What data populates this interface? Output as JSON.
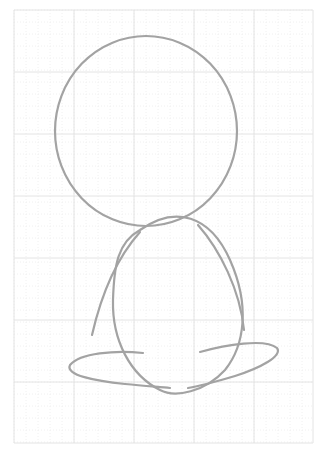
{
  "canvas": {
    "width": 323,
    "height": 457,
    "background": "#ffffff"
  },
  "grid": {
    "x0": 14,
    "y0": 10,
    "x1": 313,
    "y1": 443,
    "major_x": [
      14,
      74,
      134,
      194,
      254,
      313
    ],
    "major_y": [
      10,
      72,
      134,
      196,
      258,
      320,
      382,
      443
    ],
    "minor_step": 12,
    "major_color": "#e4e4e4",
    "minor_color": "#f0f0f0"
  },
  "sketch": {
    "stroke_color": "#a3a3a3",
    "stroke_width": 2.2,
    "shapes": [
      {
        "name": "head-circle",
        "type": "ellipse",
        "cx": 146,
        "cy": 131,
        "rx": 91,
        "ry": 95
      },
      {
        "name": "body-oval",
        "d": "M 140 230 C 175 205, 210 215, 230 260 C 250 305, 245 345, 225 370 C 205 392, 175 398, 160 390 C 130 375, 112 340, 113 300 C 114 265, 118 242, 140 230 Z"
      },
      {
        "name": "left-arm-stroke",
        "d": "M 92 335 C 100 300, 115 260, 140 232"
      },
      {
        "name": "right-inner-stroke",
        "d": "M 198 225 C 220 250, 240 290, 244 330"
      },
      {
        "name": "left-foot-loop",
        "d": "M 143 353 C 115 350, 80 353, 70 365 C 65 375, 95 381, 125 384 C 145 386, 160 387, 170 388"
      },
      {
        "name": "right-foot-loop",
        "d": "M 200 352 C 225 345, 265 338, 277 348 C 283 356, 260 368, 235 376 C 215 382, 200 386, 188 388"
      }
    ]
  }
}
